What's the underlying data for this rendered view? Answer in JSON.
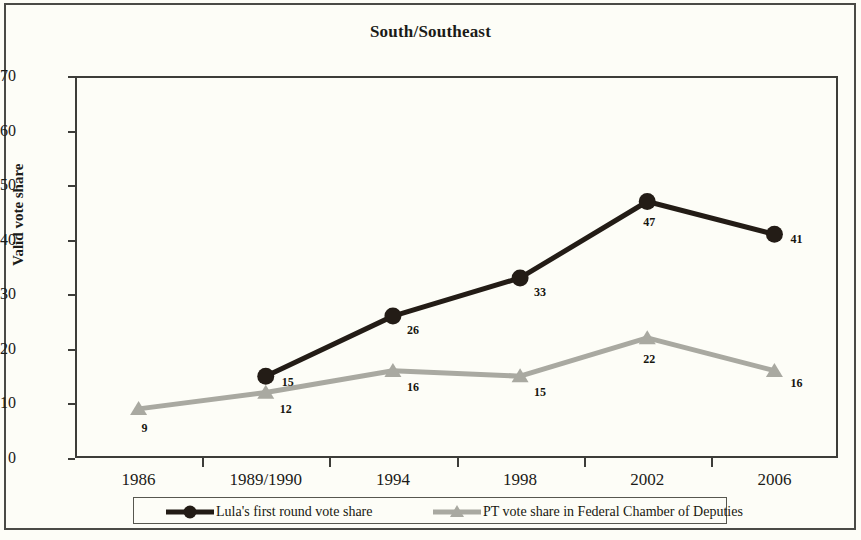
{
  "chart_data": {
    "type": "line",
    "title": "South/Southeast",
    "xlabel": "",
    "ylabel": "Valid vote share",
    "categories": [
      "1986",
      "1989/1990",
      "1994",
      "1998",
      "2002",
      "2006"
    ],
    "ylim": [
      0,
      70
    ],
    "ytick_step": 10,
    "yticks": [
      "70",
      "60",
      "50",
      "40",
      "30",
      "20",
      "10",
      "0"
    ],
    "grid": false,
    "legend_position": "bottom",
    "series": [
      {
        "name": "Lula's first round vote share",
        "color": "#231c16",
        "marker": "circle",
        "values": [
          null,
          15,
          26,
          33,
          47,
          41
        ],
        "labels": [
          "",
          "15",
          "26",
          "33",
          "47",
          "41"
        ]
      },
      {
        "name": "PT vote share in Federal Chamber of Deputies",
        "color": "#a9a9a1",
        "marker": "triangle",
        "values": [
          9,
          12,
          16,
          15,
          22,
          16
        ],
        "labels": [
          "9",
          "12",
          "16",
          "15",
          "22",
          "16"
        ]
      }
    ]
  },
  "axis": {
    "y_title": "Valid vote share",
    "y_ticks": [
      "70",
      "60",
      "50",
      "40",
      "30",
      "20",
      "10",
      "0"
    ],
    "x_ticks": [
      "1986",
      "1989/1990",
      "1994",
      "1998",
      "2002",
      "2006"
    ]
  },
  "title": {
    "text": "South/Southeast"
  },
  "legend": {
    "items": [
      {
        "label": "Lula's first round vote share"
      },
      {
        "label": "PT vote share in Federal Chamber of Deputies"
      }
    ]
  },
  "labels": {
    "black": {
      "p1": "15",
      "p2": "26",
      "p3": "33",
      "p4": "47",
      "p5": "41"
    },
    "gray": {
      "p0": "9",
      "p1": "12",
      "p2": "16",
      "p3": "15",
      "p4": "22",
      "p5": "16"
    }
  },
  "colors": {
    "series_black": "#231c16",
    "series_gray": "#a9a9a1",
    "axis": "#3d3d39",
    "background": "#fdfdf7"
  }
}
